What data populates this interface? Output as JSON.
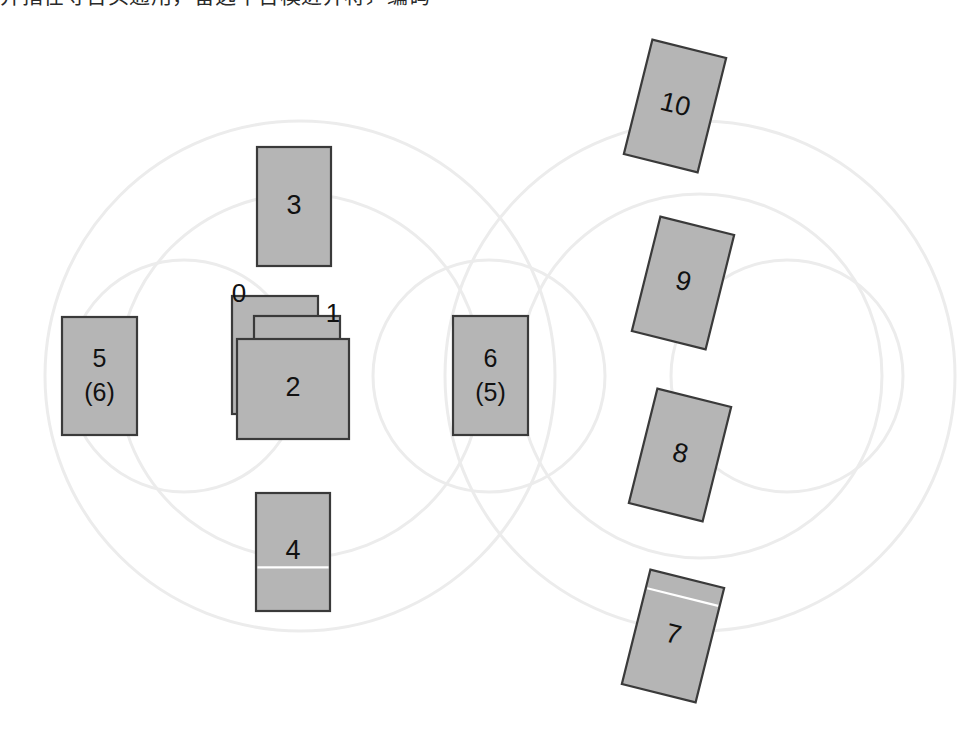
{
  "caption": {
    "text": "并指在寻台头通用，备选中台模进并将〕编码"
  },
  "diagram": {
    "type": "block-layout-diagram",
    "canvas": {
      "width": 970,
      "height": 737
    },
    "colors": {
      "rect_fill": "#b5b5b5",
      "rect_stroke": "#3a3a3a",
      "circle_stroke": "#ececec",
      "label_color": "#111111",
      "background": "#ffffff",
      "seam_color": "#ffffff"
    },
    "background_circles": [
      {
        "name": "left-outer-circle",
        "cx": 300,
        "cy": 376,
        "r": 255
      },
      {
        "name": "left-inner-circle",
        "cx": 300,
        "cy": 376,
        "r": 182
      },
      {
        "name": "right-outer-circle",
        "cx": 700,
        "cy": 376,
        "r": 255
      },
      {
        "name": "right-inner-circle",
        "cx": 700,
        "cy": 376,
        "r": 182
      },
      {
        "name": "center-small-circle",
        "cx": 489,
        "cy": 376,
        "r": 116
      },
      {
        "name": "right-small-circle",
        "cx": 787,
        "cy": 376,
        "r": 116
      },
      {
        "name": "left-small-circle",
        "cx": 184,
        "cy": 376,
        "r": 116
      }
    ],
    "rectangles": [
      {
        "id": "0",
        "label": "0",
        "label_position": "outside-top-left",
        "x": 232,
        "y": 296,
        "w": 86,
        "h": 118,
        "rotation": 0,
        "z": 1,
        "seam": false
      },
      {
        "id": "1",
        "label": "1",
        "label_position": "outside-top-right",
        "x": 254,
        "y": 316,
        "w": 86,
        "h": 118,
        "rotation": 0,
        "z": 2,
        "seam": false
      },
      {
        "id": "2",
        "label": "2",
        "label_position": "inside",
        "x": 237,
        "y": 339,
        "w": 112,
        "h": 100,
        "rotation": 0,
        "z": 3,
        "seam": false
      },
      {
        "id": "3",
        "label": "3",
        "label_position": "inside",
        "x": 257,
        "y": 147,
        "w": 74,
        "h": 119,
        "rotation": 0,
        "z": 0,
        "seam": false
      },
      {
        "id": "4",
        "label": "4",
        "label_position": "inside",
        "x": 256,
        "y": 493,
        "w": 74,
        "h": 118,
        "rotation": 0,
        "z": 0,
        "seam": true,
        "seam_y_frac": 0.63
      },
      {
        "id": "5",
        "label": "5\n(6)",
        "label_line1": "5",
        "label_line2": "(6)",
        "label_position": "inside",
        "x": 62,
        "y": 317,
        "w": 75,
        "h": 118,
        "rotation": 0,
        "z": 0,
        "seam": false
      },
      {
        "id": "6",
        "label": "6\n(5)",
        "label_line1": "6",
        "label_line2": "(5)",
        "label_position": "inside",
        "x": 453,
        "y": 316,
        "w": 75,
        "h": 119,
        "rotation": 0,
        "z": 0,
        "seam": false
      },
      {
        "id": "7",
        "label": "7",
        "label_position": "inside",
        "x": 635,
        "y": 577,
        "w": 76,
        "h": 118,
        "rotation": 14,
        "z": 0,
        "seam": true,
        "seam_y_frac": 0.16
      },
      {
        "id": "8",
        "label": "8",
        "label_position": "inside",
        "x": 642,
        "y": 396,
        "w": 76,
        "h": 118,
        "rotation": 14,
        "z": 0,
        "seam": false
      },
      {
        "id": "9",
        "label": "9",
        "label_position": "inside",
        "x": 645,
        "y": 224,
        "w": 76,
        "h": 118,
        "rotation": 14,
        "z": 0,
        "seam": false
      },
      {
        "id": "10",
        "label": "10",
        "label_position": "inside",
        "x": 637,
        "y": 47,
        "w": 76,
        "h": 118,
        "rotation": 14,
        "z": 0,
        "seam": false
      }
    ]
  }
}
